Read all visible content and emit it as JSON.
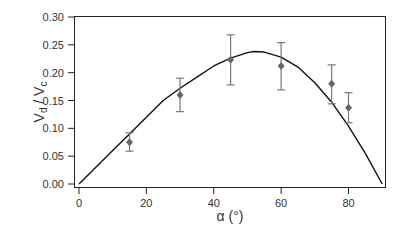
{
  "chart_data": {
    "type": "scatter",
    "title": "",
    "xlabel": "α (°)",
    "ylabel": "Vd / Vc",
    "ylabel_parts": {
      "v1": "V",
      "sub1": "d",
      "sep": " / ",
      "v2": "V",
      "sub2": "c"
    },
    "xlim": [
      -2,
      92
    ],
    "ylim": [
      -0.005,
      0.305
    ],
    "x_ticks": [
      0,
      20,
      40,
      60,
      80
    ],
    "x_tick_labels": [
      "0",
      "20",
      "40",
      "60",
      "80"
    ],
    "y_ticks": [
      0.0,
      0.05,
      0.1,
      0.15,
      0.2,
      0.25,
      0.3
    ],
    "y_tick_labels": [
      "0.00",
      "0.05",
      "0.10",
      "0.15",
      "0.20",
      "0.25",
      "0.30"
    ],
    "grid": false,
    "legend": null,
    "series": [
      {
        "name": "measured",
        "kind": "points_with_errorbars",
        "marker": "diamond",
        "color": "#666666",
        "x": [
          15,
          30,
          45,
          60,
          75,
          80
        ],
        "y": [
          0.075,
          0.16,
          0.223,
          0.212,
          0.18,
          0.137
        ],
        "y_err_low": [
          0.059,
          0.13,
          0.178,
          0.169,
          0.144,
          0.11
        ],
        "y_err_high": [
          0.092,
          0.19,
          0.268,
          0.254,
          0.214,
          0.164
        ]
      },
      {
        "name": "model",
        "kind": "line",
        "color": "#111111",
        "x": [
          0,
          5,
          10,
          15,
          20,
          25,
          30,
          35,
          40,
          45,
          50,
          52,
          55,
          60,
          65,
          70,
          75,
          80,
          85,
          90
        ],
        "y": [
          0,
          0.03,
          0.06,
          0.09,
          0.12,
          0.15,
          0.172,
          0.192,
          0.212,
          0.226,
          0.236,
          0.238,
          0.237,
          0.228,
          0.21,
          0.182,
          0.147,
          0.104,
          0.055,
          0
        ]
      }
    ]
  }
}
